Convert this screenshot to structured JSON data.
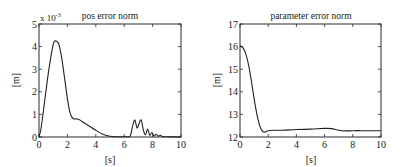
{
  "chart_data": [
    {
      "type": "line",
      "title": "pos error norm",
      "xlabel": "[s]",
      "ylabel": "[m]",
      "y_multiplier_label": "x 10^-3",
      "y_multiplier_base": "x 10",
      "y_multiplier_exp": "-3",
      "xlim": [
        0,
        10
      ],
      "ylim": [
        0,
        5
      ],
      "xticks": [
        "0",
        "2",
        "4",
        "6",
        "8",
        "10"
      ],
      "yticks": [
        "0",
        "1",
        "2",
        "3",
        "4",
        "5"
      ],
      "grid": false,
      "series": [
        {
          "name": "pos error norm (x1e-3)",
          "x": [
            0,
            0.15,
            0.4,
            0.7,
            1.0,
            1.2,
            1.4,
            1.6,
            1.8,
            2.0,
            2.2,
            2.4,
            2.6,
            2.8,
            3.0,
            3.5,
            4.0,
            4.5,
            5.0,
            5.5,
            6.0,
            6.4,
            6.6,
            6.75,
            6.9,
            7.05,
            7.2,
            7.35,
            7.5,
            7.65,
            7.8,
            7.95,
            8.1,
            8.25,
            8.4,
            8.55,
            8.7,
            9.0,
            10.0
          ],
          "y": [
            0,
            0.4,
            1.6,
            3.0,
            4.1,
            4.25,
            4.1,
            3.5,
            2.6,
            1.7,
            1.05,
            0.82,
            0.8,
            0.78,
            0.7,
            0.5,
            0.3,
            0.12,
            0.03,
            0.01,
            0.01,
            0.02,
            0.5,
            0.75,
            0.4,
            0.6,
            0.75,
            0.3,
            0.1,
            0.35,
            0.08,
            0.2,
            0.05,
            0.12,
            0.04,
            0.07,
            0.02,
            0.01,
            0.0
          ]
        }
      ]
    },
    {
      "type": "line",
      "title": "parameter error norm",
      "xlabel": "[s]",
      "ylabel": "[m]",
      "xlim": [
        0,
        10
      ],
      "ylim": [
        12,
        17
      ],
      "xticks": [
        "0",
        "2",
        "4",
        "6",
        "8",
        "10"
      ],
      "yticks": [
        "12",
        "13",
        "14",
        "15",
        "16",
        "17"
      ],
      "grid": false,
      "series": [
        {
          "name": "parameter error norm",
          "x": [
            0,
            0.2,
            0.4,
            0.6,
            0.8,
            1.0,
            1.2,
            1.4,
            1.6,
            1.8,
            2.0,
            2.5,
            3.0,
            4.0,
            5.0,
            6.0,
            6.5,
            7.0,
            7.5,
            8.0,
            9.0,
            10.0
          ],
          "y": [
            16.05,
            15.95,
            15.7,
            15.2,
            14.5,
            13.7,
            13.0,
            12.5,
            12.25,
            12.22,
            12.28,
            12.3,
            12.3,
            12.33,
            12.35,
            12.38,
            12.37,
            12.3,
            12.27,
            12.28,
            12.28,
            12.28
          ]
        }
      ]
    }
  ]
}
